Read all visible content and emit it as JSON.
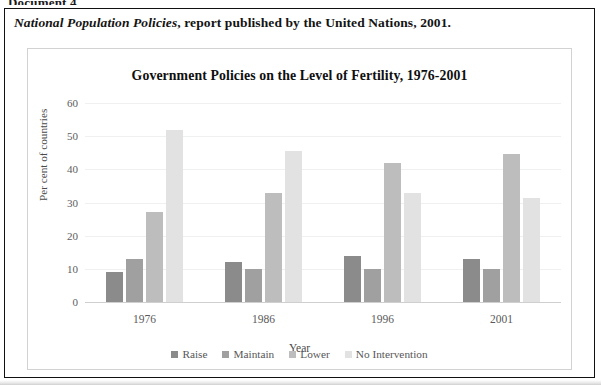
{
  "document": {
    "heading": "Document 4",
    "source_italic": "National Population Policies",
    "source_rest": ", report published by the United Nations, 2001."
  },
  "chart_data": {
    "type": "bar",
    "title": "Government Policies on the Level of Fertility, 1976-2001",
    "xlabel": "Year",
    "ylabel": "Per cent of countries",
    "categories": [
      "1976",
      "1986",
      "1996",
      "2001"
    ],
    "ylim": [
      0,
      60
    ],
    "yticks": [
      "0",
      "10",
      "20",
      "30",
      "40",
      "50",
      "60"
    ],
    "grid": true,
    "legend_position": "bottom",
    "series": [
      {
        "name": "Raise",
        "color": "#8b8b8b",
        "values": [
          9,
          12,
          14,
          13
        ]
      },
      {
        "name": "Maintain",
        "color": "#a0a0a0",
        "values": [
          13,
          10,
          10,
          10
        ]
      },
      {
        "name": "Lower",
        "color": "#bdbdbd",
        "values": [
          27,
          33,
          42,
          44.5
        ]
      },
      {
        "name": "No Intervention",
        "color": "#e2e2e2",
        "values": [
          52,
          45.5,
          33,
          31.5
        ]
      }
    ]
  }
}
